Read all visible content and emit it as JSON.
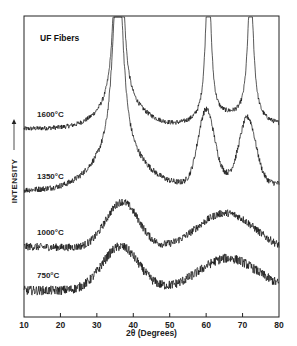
{
  "chart_data": {
    "type": "line",
    "title": "UF Fibers",
    "xlabel": "2θ (Degrees)",
    "ylabel": "INTENSITY",
    "ylabel_arrow": "→",
    "xlim": [
      10,
      80
    ],
    "xticks": [
      10,
      20,
      30,
      40,
      50,
      60,
      70,
      80
    ],
    "grid": false,
    "legend_position": "inline labels left of each curve",
    "y_units": "arbitrary (stacked, offset curves)",
    "series": [
      {
        "name": "1600°C",
        "baseline_start": 0.62,
        "baseline_end": 0.63,
        "peaks": [
          {
            "center": 36.0,
            "height": 1.0,
            "width": 1.1
          },
          {
            "center": 60.6,
            "height": 0.52,
            "width": 0.9
          },
          {
            "center": 72.2,
            "height": 0.45,
            "width": 1.0
          }
        ],
        "broad": [
          {
            "center": 37.0,
            "height": 0.06,
            "width": 6.0
          },
          {
            "center": 66.0,
            "height": 0.03,
            "width": 7.0
          }
        ],
        "noise": 0.008
      },
      {
        "name": "1350°C",
        "baseline_start": 0.41,
        "baseline_end": 0.43,
        "peaks": [
          {
            "center": 35.8,
            "height": 0.72,
            "width": 1.6
          },
          {
            "center": 60.0,
            "height": 0.24,
            "width": 2.2
          },
          {
            "center": 71.4,
            "height": 0.21,
            "width": 2.2
          }
        ],
        "broad": [
          {
            "center": 36.0,
            "height": 0.1,
            "width": 7.0
          },
          {
            "center": 66.0,
            "height": 0.03,
            "width": 7.0
          }
        ],
        "noise": 0.01
      },
      {
        "name": "1000°C",
        "baseline_start": 0.22,
        "baseline_end": 0.2,
        "peaks": [
          {
            "center": 37.0,
            "height": 0.16,
            "width": 4.5
          }
        ],
        "broad": [
          {
            "center": 65.5,
            "height": 0.13,
            "width": 8.0
          }
        ],
        "noise": 0.013
      },
      {
        "name": "750°C",
        "baseline_start": 0.07,
        "baseline_end": 0.07,
        "peaks": [
          {
            "center": 36.5,
            "height": 0.15,
            "width": 5.0
          }
        ],
        "broad": [
          {
            "center": 66.0,
            "height": 0.11,
            "width": 8.0
          }
        ],
        "noise": 0.016
      }
    ]
  }
}
